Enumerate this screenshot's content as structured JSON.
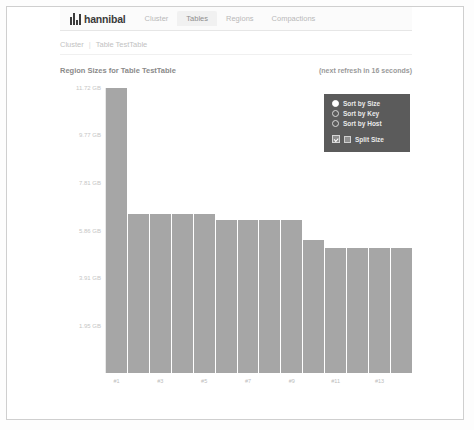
{
  "navbar": {
    "brand": "hannibal",
    "brand_logo_icon": "bar-chart-logo-icon",
    "items": [
      {
        "label": "Cluster",
        "active": false
      },
      {
        "label": "Tables",
        "active": true
      },
      {
        "label": "Regions",
        "active": false
      },
      {
        "label": "Compactions",
        "active": false
      }
    ]
  },
  "breadcrumb": {
    "items": [
      "Cluster",
      "Table TestTable"
    ],
    "separator": "|"
  },
  "chart_header": {
    "title": "Region Sizes for Table TestTable",
    "refresh": "(next refresh in 16 seconds)"
  },
  "legend": {
    "sort_options": [
      {
        "label": "Sort by Size",
        "selected": true
      },
      {
        "label": "Sort by Key",
        "selected": false
      },
      {
        "label": "Sort by Host",
        "selected": false
      }
    ],
    "split_size": {
      "label": "Split Size",
      "checked": true
    }
  },
  "chart_data": {
    "type": "bar",
    "title": "Region Sizes for Table TestTable",
    "xlabel": "",
    "ylabel": "",
    "grid": false,
    "legend_position": "top-right",
    "ylim": [
      0,
      11.72
    ],
    "yticks": [
      1.95,
      3.91,
      5.86,
      7.81,
      9.77,
      11.72
    ],
    "ytick_labels": [
      "1.95 GB",
      "3.91 GB",
      "5.86 GB",
      "7.81 GB",
      "9.77 GB",
      "11.72 GB"
    ],
    "categories": [
      "#1",
      "#2",
      "#3",
      "#4",
      "#5",
      "#6",
      "#7",
      "#8",
      "#9",
      "#10",
      "#11",
      "#12",
      "#13",
      "#14"
    ],
    "xtick_labels": [
      "#1",
      "",
      "#3",
      "",
      "#5",
      "",
      "#7",
      "",
      "#9",
      "",
      "#11",
      "",
      "#13",
      ""
    ],
    "values": [
      11.72,
      6.55,
      6.55,
      6.55,
      6.55,
      6.3,
      6.3,
      6.3,
      6.3,
      5.45,
      5.15,
      5.15,
      5.15,
      5.15
    ],
    "series": [
      {
        "name": "Region Size",
        "values": [
          11.72,
          6.55,
          6.55,
          6.55,
          6.55,
          6.3,
          6.3,
          6.3,
          6.3,
          5.45,
          5.15,
          5.15,
          5.15,
          5.15
        ]
      }
    ],
    "bar_color": "#a6a6a6"
  }
}
